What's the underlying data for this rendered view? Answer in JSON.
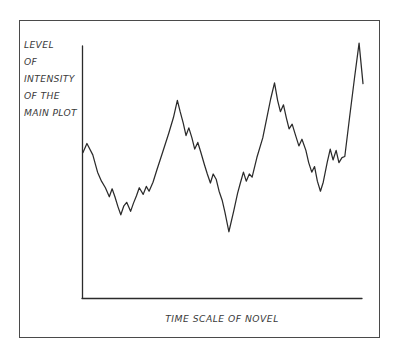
{
  "figure": {
    "name": "story-intensity-chart",
    "background_color": "#ffffff",
    "frame_color": "#4a4a4a",
    "ink_color": "#2b2b2b",
    "text_color": "#3a3a3a"
  },
  "chart_data": {
    "type": "line",
    "title": "",
    "subtitle": "",
    "xlabel": "TIME SCALE OF NOVEL",
    "ylabel_lines": [
      "LEVEL",
      "OF",
      "INTENSITY",
      "OF THE",
      "MAIN PLOT"
    ],
    "ylabel": "LEVEL OF INTENSITY OF THE MAIN PLOT",
    "grid": false,
    "legend": null,
    "axis_ticks_x": [],
    "axis_ticks_y": [],
    "xlim": [
      0,
      100
    ],
    "ylim": [
      0,
      100
    ],
    "series": [
      {
        "name": "main plot intensity",
        "color": "#2b2b2b",
        "x": [
          0.0,
          1.4,
          3.5,
          5.2,
          6.6,
          8.0,
          9.4,
          10.4,
          11.4,
          12.5,
          13.5,
          14.6,
          15.6,
          17.0,
          18.0,
          19.1,
          20.1,
          21.5,
          22.6,
          23.6,
          25.0,
          26.4,
          28.5,
          30.6,
          32.3,
          33.7,
          34.7,
          35.8,
          36.8,
          37.8,
          38.9,
          39.9,
          41.0,
          42.0,
          43.4,
          44.4,
          45.5,
          46.5,
          47.6,
          48.6,
          49.7,
          50.7,
          52.1,
          53.8,
          55.2,
          56.2,
          57.3,
          58.3,
          59.4,
          60.4,
          62.1,
          64.2,
          65.6,
          67.0,
          68.4,
          69.5,
          70.5,
          71.6,
          72.6,
          73.6,
          74.7,
          75.7,
          77.1,
          78.2,
          79.6,
          80.6,
          81.7,
          82.7,
          83.7,
          84.8,
          85.8,
          87.2,
          88.3,
          89.3,
          90.4,
          91.4,
          92.5,
          93.5,
          95.2,
          97.0,
          98.6,
          100.0
        ],
        "y": [
          54.9,
          58.3,
          54.0,
          47.5,
          44.1,
          41.6,
          38.2,
          41.2,
          38.2,
          34.4,
          31.4,
          34.8,
          36.1,
          32.7,
          35.7,
          38.6,
          41.6,
          39.1,
          42.1,
          40.3,
          43.7,
          48.4,
          55.2,
          62.1,
          68.1,
          74.6,
          70.3,
          66.0,
          61.3,
          64.2,
          60.4,
          56.2,
          58.7,
          55.3,
          50.2,
          46.8,
          43.4,
          46.8,
          44.7,
          40.3,
          36.9,
          32.3,
          25.0,
          32.7,
          39.5,
          43.4,
          47.5,
          44.1,
          46.8,
          45.6,
          53.0,
          60.4,
          67.7,
          75.0,
          81.2,
          74.6,
          70.3,
          72.9,
          68.1,
          63.8,
          65.6,
          62.1,
          57.4,
          59.9,
          55.7,
          51.1,
          47.5,
          49.6,
          44.1,
          40.3,
          43.7,
          51.1,
          56.2,
          52.1,
          55.7,
          51.1,
          53.0,
          53.4,
          68.1,
          83.3,
          96.2,
          80.9
        ]
      }
    ],
    "annotations": []
  },
  "labels": {
    "y_axis_line_1": "LEVEL",
    "y_axis_line_2": "OF",
    "y_axis_line_3": "INTENSITY",
    "y_axis_line_4": "OF THE",
    "y_axis_line_5": "MAIN PLOT",
    "x_axis": "TIME SCALE OF NOVEL"
  }
}
